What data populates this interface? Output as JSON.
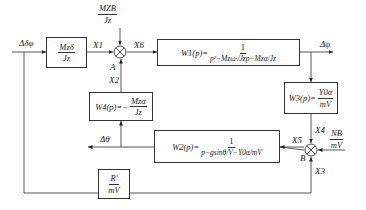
{
  "diagram": {
    "type": "control block diagram",
    "input_label": "Δδφ",
    "output_label": "Δφ",
    "feedback_label_theta": "Δθ",
    "signals": {
      "x1": "X1",
      "x2": "X2",
      "x3": "X3",
      "x4": "X4",
      "x5": "X5",
      "x6": "X6"
    },
    "summing_points": {
      "a": "A",
      "b": "B"
    },
    "disturbance_a": {
      "num": "MZB",
      "den": "Jz"
    },
    "disturbance_b": {
      "num": "NB",
      "den": "mV"
    },
    "blocks": {
      "gain_input": {
        "num": "Mzδ",
        "den": "Jz"
      },
      "w1": {
        "name": "W1(p)=",
        "num": "1",
        "den": "p²−Mzω·/Jzp−Mzα/Jz"
      },
      "w3": {
        "name": "W3(p)=",
        "num": "Y0α",
        "den": "mV"
      },
      "w4": {
        "name": "W4(p)=−",
        "num": "Mzα",
        "den": "Jz"
      },
      "w2": {
        "name": "W2(p)=",
        "num": "1",
        "den": "p−gsinθ/V−Y0α/mV"
      },
      "r_gain": {
        "num": "R′",
        "den": "mV"
      }
    }
  }
}
